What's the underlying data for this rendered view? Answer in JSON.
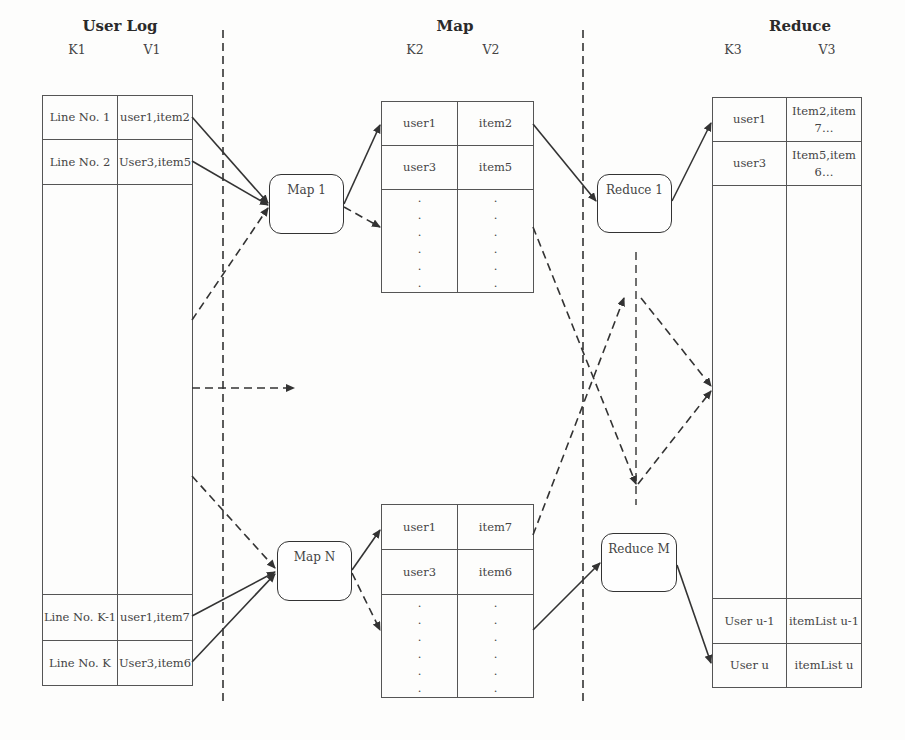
{
  "sections": {
    "user_log": {
      "title": "User Log",
      "k_label": "K1",
      "v_label": "V1"
    },
    "map": {
      "title": "Map",
      "k_label": "K2",
      "v_label": "V2"
    },
    "reduce": {
      "title": "Reduce",
      "k_label": "K3",
      "v_label": "V3"
    }
  },
  "user_log_table": {
    "rows_top": [
      {
        "k": "Line No. 1",
        "v": "user1,item2"
      },
      {
        "k": "Line No. 2",
        "v": "User3,item5"
      }
    ],
    "rows_bottom": [
      {
        "k": "Line No. K-1",
        "v": "user1,item7"
      },
      {
        "k": "Line No. K",
        "v": "User3,item6"
      }
    ]
  },
  "map_tables": [
    {
      "rows": [
        {
          "k": "user1",
          "v": "item2"
        },
        {
          "k": "user3",
          "v": "item5"
        }
      ],
      "ellipsis": ".\n.\n.\n.\n.\n."
    },
    {
      "rows": [
        {
          "k": "user1",
          "v": "item7"
        },
        {
          "k": "user3",
          "v": "item6"
        }
      ],
      "ellipsis": ".\n.\n.\n.\n.\n."
    }
  ],
  "reduce_table": {
    "rows_top": [
      {
        "k": "user1",
        "v": "Item2,item7…"
      },
      {
        "k": "user3",
        "v": "Item5,item6…"
      }
    ],
    "rows_bottom": [
      {
        "k": "User u-1",
        "v": "itemList u-1"
      },
      {
        "k": "User u",
        "v": "itemList u"
      }
    ]
  },
  "nodes": {
    "map1": "Map 1",
    "mapN": "Map N",
    "reduce1": "Reduce 1",
    "reduceM": "Reduce M"
  },
  "colors": {
    "line": "#333333",
    "border": "#555555",
    "background": "#fdfdfc"
  }
}
